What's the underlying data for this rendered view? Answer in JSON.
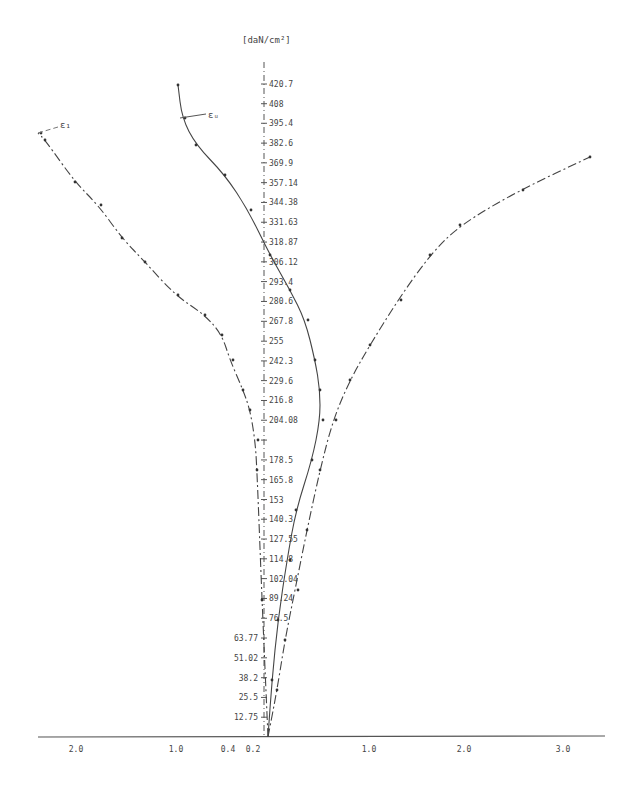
{
  "chart_data": {
    "type": "line",
    "title": "",
    "ylabel": "[daN/cm²]",
    "xlabel": "",
    "x_tick_labels_left": [
      "2.0",
      "1.0",
      "0.4",
      "0.2"
    ],
    "x_tick_labels_right": [
      "1.0",
      "2.0",
      "3.0"
    ],
    "y_ticks": [
      12.75,
      25.5,
      38.2,
      51.02,
      63.77,
      76.5,
      89.24,
      102.04,
      114.8,
      127.55,
      140.3,
      153,
      165.8,
      178.5,
      191.3,
      204.08,
      216.8,
      229.6,
      242.3,
      255,
      267.8,
      280.6,
      293.4,
      306.12,
      318.87,
      331.63,
      344.38,
      357.14,
      369.9,
      382.6,
      395.4,
      408,
      420.7
    ],
    "y_tick_labels": [
      "12.75",
      "25.5",
      "38.2",
      "51.02",
      "63.77",
      "76.5",
      "89.24",
      "102.04",
      "114.8",
      "127.55",
      "140.3",
      "153",
      "165.8",
      "178.5",
      "",
      "204.08",
      "216.8",
      "229.6",
      "242.3",
      "255",
      "267.8",
      "280.6",
      "293.4",
      "306.12",
      "318.87",
      "331.63",
      "344.38",
      "357.14",
      "369.9",
      "382.6",
      "395.4",
      "408",
      "420.7"
    ],
    "ylim": [
      0,
      430
    ],
    "grid": false,
    "series": [
      {
        "name": "ε₁ (left, dash-dot)",
        "label": "ε₁",
        "style": "dash-dot",
        "points_px": [
          [
            268,
            737
          ],
          [
            262,
            600
          ],
          [
            257,
            470
          ],
          [
            255,
            440
          ],
          [
            250,
            410
          ],
          [
            243,
            390
          ],
          [
            230,
            360
          ],
          [
            222,
            335
          ],
          [
            205,
            315
          ],
          [
            175,
            295
          ],
          [
            145,
            262
          ],
          [
            122,
            238
          ],
          [
            98,
            205
          ],
          [
            75,
            182
          ],
          [
            45,
            140
          ],
          [
            38,
            133
          ]
        ]
      },
      {
        "name": "εᵤ (middle)",
        "label": "εᵤ",
        "style": "solid",
        "points_px": [
          [
            268,
            737
          ],
          [
            272,
            680
          ],
          [
            278,
            620
          ],
          [
            287,
            560
          ],
          [
            296,
            510
          ],
          [
            312,
            460
          ],
          [
            320,
            420
          ],
          [
            320,
            390
          ],
          [
            315,
            360
          ],
          [
            305,
            320
          ],
          [
            290,
            290
          ],
          [
            270,
            255
          ],
          [
            248,
            210
          ],
          [
            225,
            175
          ],
          [
            196,
            145
          ],
          [
            182,
            118
          ],
          [
            178,
            85
          ]
        ]
      },
      {
        "name": "right curve (dash-dot)",
        "label": "",
        "style": "dash-dot",
        "points_px": [
          [
            268,
            737
          ],
          [
            277,
            690
          ],
          [
            285,
            640
          ],
          [
            295,
            590
          ],
          [
            307,
            530
          ],
          [
            320,
            470
          ],
          [
            333,
            420
          ],
          [
            350,
            380
          ],
          [
            370,
            345
          ],
          [
            398,
            300
          ],
          [
            430,
            255
          ],
          [
            460,
            225
          ],
          [
            520,
            190
          ],
          [
            590,
            157
          ]
        ]
      }
    ]
  },
  "labels": {
    "unit": "[daN/cm²]",
    "curve_left_label": "ε₁",
    "curve_mid_label": "εᵤ"
  }
}
